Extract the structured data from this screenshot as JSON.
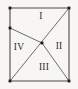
{
  "figure": {
    "background": "#f7f6f2",
    "line_color": "#4a4a46",
    "dot_color": "#1d1d1a",
    "label_color": "#2b2b27",
    "viewbox": {
      "width": 78,
      "height": 89
    },
    "points": {
      "top_left": {
        "x": 10,
        "y": 8
      },
      "top_right": {
        "x": 69,
        "y": 8
      },
      "bottom_right": {
        "x": 69,
        "y": 81
      },
      "bottom_left": {
        "x": 10,
        "y": 81
      },
      "left_edge_point": {
        "x": 10,
        "y": 28
      },
      "interior_point": {
        "x": 42,
        "y": 43
      }
    },
    "segments": [
      {
        "name": "top-edge",
        "from": "top_left",
        "to": "top_right",
        "width": 1.1
      },
      {
        "name": "right-edge",
        "from": "top_right",
        "to": "bottom_right",
        "width": 1.1
      },
      {
        "name": "bottom-edge",
        "from": "bottom_right",
        "to": "bottom_left",
        "width": 1.1
      },
      {
        "name": "left-edge",
        "from": "bottom_left",
        "to": "top_left",
        "width": 1.1
      },
      {
        "name": "diagonal-tr-bl",
        "from": "top_right",
        "to": "bottom_left",
        "width": 0.8
      },
      {
        "name": "cevian-left-to-interior",
        "from": "left_edge_point",
        "to": "interior_point",
        "width": 0.8
      },
      {
        "name": "cevian-interior-to-br",
        "from": "interior_point",
        "to": "bottom_right",
        "width": 0.8
      }
    ],
    "dots": [
      "top_left",
      "top_right",
      "bottom_right",
      "bottom_left",
      "left_edge_point",
      "interior_point"
    ],
    "dot_size": 2.8,
    "labels": [
      {
        "text": "I",
        "x": 41,
        "y": 16
      },
      {
        "text": "II",
        "x": 59,
        "y": 46
      },
      {
        "text": "III",
        "x": 44,
        "y": 67
      },
      {
        "text": "IV",
        "x": 19,
        "y": 47
      }
    ]
  }
}
